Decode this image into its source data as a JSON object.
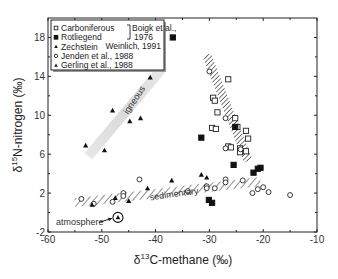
{
  "chart_data": {
    "type": "scatter",
    "title": "",
    "xlabel": "δ13C-methane (‰)",
    "xlabel_parts": {
      "prefix": "δ",
      "sup": "13",
      "rest": "C-methane (‰)"
    },
    "ylabel": "δ15N-nitrogen (‰)",
    "ylabel_parts": {
      "prefix": "δ",
      "sup": "15",
      "rest": "N-nitrogen (‰)"
    },
    "xlim": [
      -60,
      -10
    ],
    "ylim": [
      -2,
      20
    ],
    "xticks": [
      -60,
      -50,
      -40,
      -30,
      -20,
      -10
    ],
    "yticks": [
      -2,
      2,
      6,
      10,
      14,
      18
    ],
    "grid": false,
    "legend_position": "upper-left",
    "legend": [
      {
        "label": "Carboniferous",
        "marker": "open-square"
      },
      {
        "label": "Rotliegend",
        "marker": "filled-square"
      },
      {
        "label": "Zechstein",
        "marker": "filled-triangle"
      },
      {
        "label": "Jenden et al., 1988",
        "marker": "open-circle"
      },
      {
        "label": "Gerling et al., 1988",
        "marker": "filled-triangle"
      }
    ],
    "legend_refs": {
      "boigk": "Boigk et al.,",
      "boigk_year": "1976",
      "weinlich": "Weinlich, 1991"
    },
    "series": [
      {
        "name": "Carboniferous",
        "marker": "open-square",
        "points": [
          [
            -26.5,
            13.7
          ],
          [
            -29.3,
            11.8
          ],
          [
            -29.0,
            11.5
          ],
          [
            -28.5,
            10.3
          ],
          [
            -25.2,
            9.7
          ],
          [
            -24.8,
            8.8
          ],
          [
            -29.5,
            8.7
          ],
          [
            -28.8,
            8.6
          ],
          [
            -23.2,
            8.4
          ],
          [
            -22.8,
            7.6
          ],
          [
            -26.5,
            6.8
          ],
          [
            -26.0,
            6.7
          ],
          [
            -24.3,
            6.6
          ],
          [
            -24.3,
            6.2
          ],
          [
            -23.2,
            6.3
          ]
        ]
      },
      {
        "name": "Rotliegend",
        "marker": "filled-square",
        "points": [
          [
            -36.8,
            18.0
          ],
          [
            -31.5,
            7.7
          ],
          [
            -25.2,
            8.8
          ],
          [
            -25.5,
            4.9
          ],
          [
            -21.8,
            4.1
          ],
          [
            -21.0,
            4.5
          ],
          [
            -20.5,
            4.6
          ],
          [
            -30.1,
            1.3
          ],
          [
            -29.5,
            1.0
          ]
        ]
      },
      {
        "name": "Zechstein",
        "marker": "filled-triangle",
        "points": [
          [
            -41.0,
            13.9
          ],
          [
            -48.0,
            10.5
          ],
          [
            -42.8,
            9.7
          ],
          [
            -44.8,
            9.4
          ],
          [
            -53.0,
            6.9
          ],
          [
            -49.5,
            6.4
          ]
        ]
      },
      {
        "name": "Jenden et al., 1988",
        "marker": "open-circle",
        "points": [
          [
            -30.0,
            14.5
          ],
          [
            -27.0,
            9.7
          ],
          [
            -24.2,
            6.5
          ],
          [
            -27.0,
            6.6
          ],
          [
            -43.0,
            3.4
          ],
          [
            -27.0,
            3.4
          ],
          [
            -27.0,
            3.1
          ],
          [
            -23.8,
            3.3
          ],
          [
            -30.5,
            2.7
          ],
          [
            -30.5,
            2.5
          ],
          [
            -29.0,
            2.5
          ],
          [
            -34.0,
            2.2
          ],
          [
            -46.0,
            2.0
          ],
          [
            -46.0,
            1.7
          ],
          [
            -48.0,
            1.1
          ],
          [
            -51.5,
            0.9
          ],
          [
            -53.8,
            1.4
          ],
          [
            -20.0,
            2.6
          ],
          [
            -21.0,
            2.4
          ],
          [
            -22.0,
            2.0
          ],
          [
            -19.0,
            2.1
          ],
          [
            -15.0,
            1.8
          ]
        ]
      },
      {
        "name": "Gerling et al., 1988",
        "marker": "filled-triangle",
        "points": [
          [
            -31.5,
            3.9
          ],
          [
            -30.5,
            3.6
          ],
          [
            -37.0,
            3.3
          ],
          [
            -41.5,
            2.5
          ],
          [
            -47.5,
            1.5
          ],
          [
            -45.0,
            1.2
          ],
          [
            -51.8,
            0.8
          ]
        ]
      }
    ],
    "bands": [
      {
        "name": "igneous",
        "style": "gray-gradient",
        "from": [
          -52.5,
          5.8
        ],
        "to": [
          -38.5,
          15.0
        ],
        "width": 10
      },
      {
        "name": "hatched-thermogenic",
        "style": "hatched",
        "from": [
          -30.5,
          16.2
        ],
        "to": [
          -22.8,
          5.3
        ],
        "width": 9
      },
      {
        "name": "sedimentary",
        "style": "hatched",
        "from": [
          -55.0,
          1.0
        ],
        "to": [
          -20.5,
          3.2
        ],
        "width": 9
      }
    ],
    "annotations": [
      {
        "text": "igneous",
        "x": -43.5,
        "y": 11.4,
        "rotate": -56
      },
      {
        "text": "sedimentary",
        "x": -36.5,
        "y": 1.6,
        "rotate": -8
      },
      {
        "text": "atmosphere",
        "x": -58.5,
        "y": -1.0,
        "arrow_to": [
          -47.3,
          -0.5
        ],
        "circled_point": [
          -47.0,
          -0.5
        ]
      }
    ]
  }
}
